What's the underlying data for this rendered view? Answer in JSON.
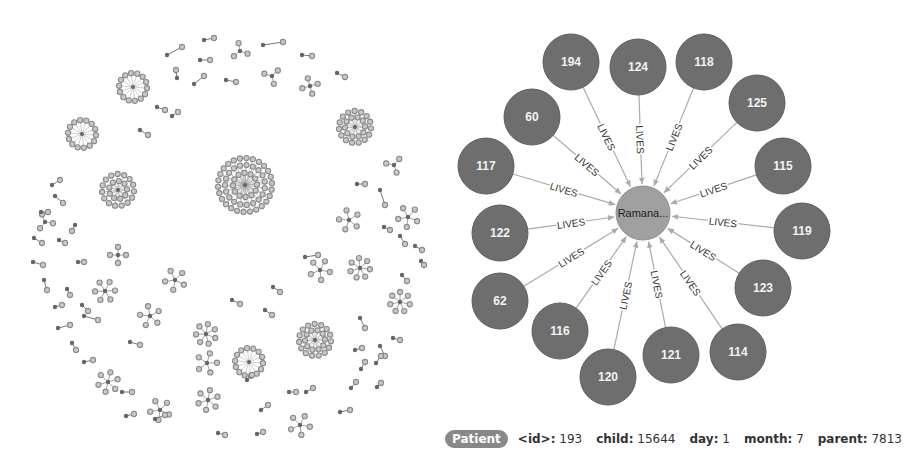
{
  "colors": {
    "node_fill": "#6e6e6e",
    "center_fill": "#a0a0a0",
    "edge": "#aaaaaa",
    "pill": "#888888",
    "mini_node": "#8a8a8a"
  },
  "detail_graph": {
    "center": {
      "label": "Ramana...",
      "x": 643,
      "y": 213
    },
    "relationship": "LIVES",
    "nodes": [
      {
        "id": "194",
        "x": 571,
        "y": 62
      },
      {
        "id": "124",
        "x": 638,
        "y": 67
      },
      {
        "id": "118",
        "x": 704,
        "y": 62
      },
      {
        "id": "60",
        "x": 532,
        "y": 117
      },
      {
        "id": "125",
        "x": 757,
        "y": 103
      },
      {
        "id": "117",
        "x": 486,
        "y": 166
      },
      {
        "id": "115",
        "x": 783,
        "y": 166
      },
      {
        "id": "122",
        "x": 500,
        "y": 233
      },
      {
        "id": "119",
        "x": 802,
        "y": 231
      },
      {
        "id": "62",
        "x": 500,
        "y": 301
      },
      {
        "id": "123",
        "x": 763,
        "y": 288
      },
      {
        "id": "116",
        "x": 560,
        "y": 331
      },
      {
        "id": "114",
        "x": 738,
        "y": 352
      },
      {
        "id": "121",
        "x": 671,
        "y": 355
      },
      {
        "id": "120",
        "x": 608,
        "y": 377
      }
    ]
  },
  "overview_graph": {
    "big_clusters": [
      {
        "x": 245,
        "y": 185,
        "r": 32,
        "rings": [
          12,
          20,
          27
        ]
      },
      {
        "x": 118,
        "y": 190,
        "r": 18,
        "rings": [
          9,
          16
        ]
      },
      {
        "x": 82,
        "y": 134,
        "r": 15,
        "rings": [
          14
        ]
      },
      {
        "x": 133,
        "y": 87,
        "r": 15,
        "rings": [
          14
        ]
      },
      {
        "x": 355,
        "y": 127,
        "r": 17,
        "rings": [
          10,
          16
        ]
      },
      {
        "x": 315,
        "y": 340,
        "r": 17,
        "rings": [
          10,
          16
        ]
      },
      {
        "x": 249,
        "y": 362,
        "r": 15,
        "rings": [
          14
        ]
      }
    ],
    "stars": [
      {
        "x": 118,
        "y": 255,
        "n": 4
      },
      {
        "x": 105,
        "y": 291,
        "n": 6
      },
      {
        "x": 150,
        "y": 316,
        "n": 5
      },
      {
        "x": 175,
        "y": 280,
        "n": 5
      },
      {
        "x": 206,
        "y": 334,
        "n": 7
      },
      {
        "x": 207,
        "y": 363,
        "n": 5
      },
      {
        "x": 108,
        "y": 382,
        "n": 6
      },
      {
        "x": 208,
        "y": 400,
        "n": 6
      },
      {
        "x": 160,
        "y": 410,
        "n": 5
      },
      {
        "x": 320,
        "y": 270,
        "n": 5
      },
      {
        "x": 360,
        "y": 268,
        "n": 7
      },
      {
        "x": 400,
        "y": 302,
        "n": 7
      },
      {
        "x": 349,
        "y": 220,
        "n": 5
      },
      {
        "x": 408,
        "y": 217,
        "n": 5
      },
      {
        "x": 300,
        "y": 425,
        "n": 5
      },
      {
        "x": 240,
        "y": 51,
        "n": 3
      },
      {
        "x": 272,
        "y": 76,
        "n": 3
      },
      {
        "x": 310,
        "y": 86,
        "n": 4
      },
      {
        "x": 394,
        "y": 165,
        "n": 3
      },
      {
        "x": 45,
        "y": 222,
        "n": 3
      }
    ],
    "pairs": [
      [
        167,
        55,
        182,
        47
      ],
      [
        204,
        40,
        214,
        38
      ],
      [
        200,
        60,
        210,
        60
      ],
      [
        177,
        78,
        176,
        70
      ],
      [
        194,
        84,
        204,
        76
      ],
      [
        157,
        107,
        165,
        110
      ],
      [
        172,
        116,
        178,
        112
      ],
      [
        140,
        130,
        148,
        135
      ],
      [
        263,
        45,
        283,
        42
      ],
      [
        302,
        55,
        312,
        56
      ],
      [
        337,
        73,
        345,
        77
      ],
      [
        226,
        80,
        236,
        82
      ],
      [
        52,
        185,
        60,
        180
      ],
      [
        55,
        196,
        63,
        203
      ],
      [
        41,
        212,
        48,
        212
      ],
      [
        75,
        225,
        72,
        231
      ],
      [
        34,
        238,
        42,
        243
      ],
      [
        59,
        240,
        65,
        243
      ],
      [
        33,
        262,
        43,
        265
      ],
      [
        78,
        262,
        84,
        262
      ],
      [
        44,
        280,
        47,
        290
      ],
      [
        67,
        289,
        70,
        295
      ],
      [
        55,
        307,
        62,
        305
      ],
      [
        82,
        305,
        88,
        311
      ],
      [
        84,
        316,
        98,
        320
      ],
      [
        58,
        328,
        70,
        325
      ],
      [
        72,
        343,
        76,
        350
      ],
      [
        130,
        342,
        140,
        345
      ],
      [
        84,
        362,
        93,
        360
      ],
      [
        122,
        392,
        132,
        392
      ],
      [
        126,
        416,
        134,
        414
      ],
      [
        155,
        419,
        165,
        415
      ],
      [
        357,
        184,
        365,
        184
      ],
      [
        380,
        190,
        385,
        205
      ],
      [
        384,
        227,
        390,
        230
      ],
      [
        415,
        246,
        422,
        250
      ],
      [
        421,
        261,
        424,
        265
      ],
      [
        402,
        275,
        407,
        281
      ],
      [
        360,
        318,
        365,
        328
      ],
      [
        393,
        338,
        400,
        340
      ],
      [
        355,
        350,
        362,
        348
      ],
      [
        380,
        346,
        385,
        356
      ],
      [
        361,
        369,
        365,
        362
      ],
      [
        376,
        363,
        381,
        356
      ],
      [
        289,
        392,
        296,
        392
      ],
      [
        306,
        392,
        313,
        388
      ],
      [
        351,
        388,
        356,
        382
      ],
      [
        377,
        387,
        381,
        383
      ],
      [
        261,
        410,
        268,
        405
      ],
      [
        257,
        434,
        263,
        432
      ],
      [
        218,
        433,
        225,
        435
      ],
      [
        247,
        380,
        252,
        375
      ],
      [
        232,
        300,
        240,
        304
      ],
      [
        265,
        310,
        272,
        315
      ],
      [
        305,
        257,
        318,
        255
      ],
      [
        273,
        287,
        280,
        292
      ],
      [
        400,
        236,
        405,
        244
      ],
      [
        340,
        412,
        350,
        410
      ]
    ]
  },
  "properties": {
    "label": "Patient",
    "items": [
      {
        "key": "<id>:",
        "value": "193"
      },
      {
        "key": "child:",
        "value": "15644"
      },
      {
        "key": "day:",
        "value": "1"
      },
      {
        "key": "month:",
        "value": "7"
      },
      {
        "key": "parent:",
        "value": "7813"
      }
    ]
  }
}
